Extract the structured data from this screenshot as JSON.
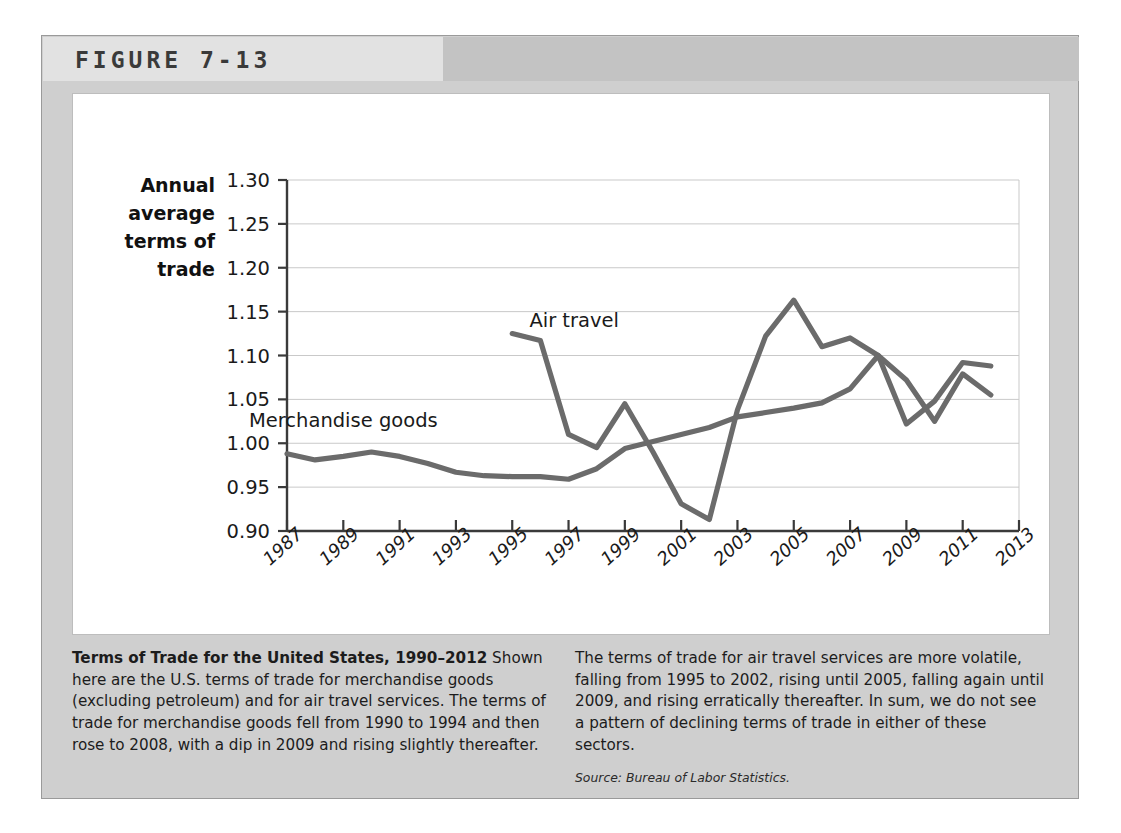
{
  "figure": {
    "label": "FIGURE 7-13"
  },
  "caption": {
    "title": "Terms of Trade for the United States, 1990–2012",
    "left_body": " Shown here are the U.S. terms of trade for merchandise goods (excluding petroleum) and for air travel services. The terms of trade for merchandise goods fell from 1990 to 1994 and then rose to 2008, with a dip in 2009 and rising slightly thereafter.",
    "right_body": "The terms of trade for air travel services are more volatile, falling from 1995 to 2002, rising until 2005, falling again until 2009, and rising erratically thereafter. In sum, we do not see a pattern of declining terms of trade in either of these sectors.",
    "source": "Source: Bureau of Labor Statistics."
  },
  "chart_data": {
    "type": "line",
    "title": "",
    "xlabel": "",
    "ylabel": "Annual average terms of trade",
    "ylabel_lines": [
      "Annual",
      "average",
      "terms of",
      "trade"
    ],
    "ylim": [
      0.9,
      1.3
    ],
    "xlim": [
      1987,
      2013
    ],
    "yticks": [
      0.9,
      0.95,
      1.0,
      1.05,
      1.1,
      1.15,
      1.2,
      1.25,
      1.3
    ],
    "ytick_labels": [
      "0.90",
      "0.95",
      "1.00",
      "1.05",
      "1.10",
      "1.15",
      "1.20",
      "1.25",
      "1.30"
    ],
    "xticks": [
      1987,
      1989,
      1991,
      1993,
      1995,
      1997,
      1999,
      2001,
      2003,
      2005,
      2007,
      2009,
      2011,
      2013
    ],
    "xtick_labels": [
      "1987",
      "1989",
      "1991",
      "1993",
      "1995",
      "1997",
      "1999",
      "2001",
      "2003",
      "2005",
      "2007",
      "2009",
      "2011",
      "2013"
    ],
    "grid": true,
    "grid_axis": "y",
    "legend": "inline-labels",
    "line_color": "#6b6b6b",
    "series": [
      {
        "name": "Merchandise goods",
        "label_x": 1989.0,
        "label_y": 1.018,
        "x": [
          1987,
          1988,
          1989,
          1990,
          1991,
          1992,
          1993,
          1994,
          1995,
          1996,
          1997,
          1998,
          1999,
          2000,
          2001,
          2002,
          2003,
          2004,
          2005,
          2006,
          2007,
          2008,
          2009,
          2010,
          2011,
          2012
        ],
        "values": [
          0.988,
          0.981,
          0.985,
          0.99,
          0.985,
          0.977,
          0.967,
          0.963,
          0.962,
          0.962,
          0.959,
          0.971,
          0.994,
          1.002,
          1.01,
          1.018,
          1.03,
          1.035,
          1.04,
          1.046,
          1.062,
          1.1,
          1.022,
          1.048,
          1.092,
          1.088
        ]
      },
      {
        "name": "Air travel",
        "label_x": 1997.2,
        "label_y": 1.133,
        "x": [
          1995,
          1996,
          1997,
          1998,
          1999,
          2000,
          2001,
          2002,
          2003,
          2004,
          2005,
          2006,
          2007,
          2008,
          2009,
          2010,
          2011,
          2012
        ],
        "values": [
          1.125,
          1.117,
          1.01,
          0.995,
          1.045,
          0.99,
          0.931,
          0.913,
          1.038,
          1.122,
          1.163,
          1.11,
          1.12,
          1.1,
          1.072,
          1.025,
          1.079,
          1.055
        ]
      }
    ]
  }
}
